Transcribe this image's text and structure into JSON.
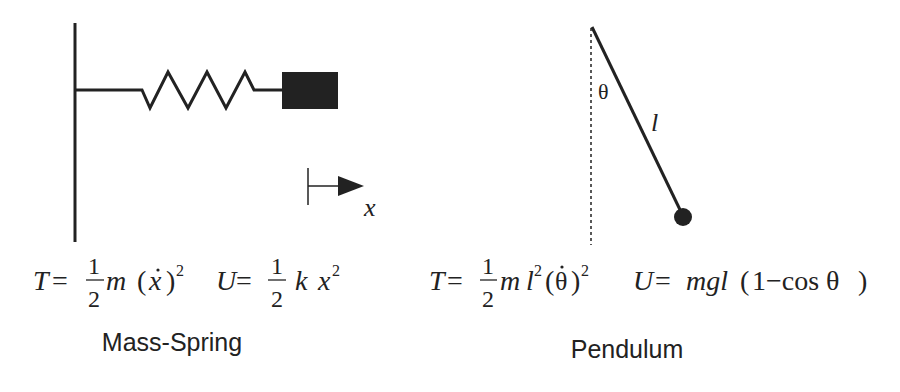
{
  "mass_spring": {
    "title": "Mass-Spring",
    "axis_label": "x",
    "kinetic": {
      "lhs": "T",
      "eq": "=",
      "num": "1",
      "den": "2",
      "rest_m": "m",
      "paren_open": "(",
      "var": "x",
      "paren_close": ")",
      "exp": "2"
    },
    "potential": {
      "lhs": "U",
      "eq": "=",
      "num": "1",
      "den": "2",
      "k": "k",
      "x": "x",
      "exp": "2"
    }
  },
  "pendulum": {
    "title": "Pendulum",
    "angle_label": "θ",
    "length_label": "l",
    "kinetic": {
      "lhs": "T",
      "eq": "=",
      "num": "1",
      "den": "2",
      "m": "m",
      "l": "l",
      "l_exp": "2",
      "paren_open": "(",
      "var": "θ",
      "paren_close": ")",
      "exp": "2"
    },
    "potential": {
      "lhs": "U",
      "eq": "=",
      "rhs": "mgl",
      "paren_open": "(",
      "inner": "1−cos θ",
      "paren_close": ")"
    }
  },
  "colors": {
    "ink": "#222222",
    "background": "#ffffff"
  }
}
